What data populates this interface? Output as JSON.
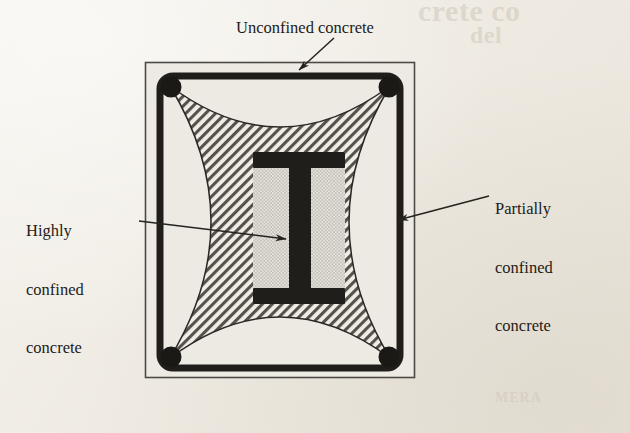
{
  "figure": {
    "background_color": "#efebe3",
    "ink_color": "#1d1b18"
  },
  "labels": {
    "unconfined": "Unconfined concrete",
    "highly_line1": "Highly",
    "highly_line2": "confined",
    "highly_line3": "concrete",
    "partially_line1": "Partially",
    "partially_line2": "confined",
    "partially_line3": "concrete"
  },
  "ghost_text": {
    "title": "crete co",
    "subtitle": "del",
    "footer": "MERA"
  },
  "regions": [
    {
      "name": "unconfined-concrete",
      "label": "Unconfined concrete",
      "fill": "light-plain",
      "fill_color": "#edeae4",
      "description": "Concrete cover outside the parabolic arching lines between tie corners"
    },
    {
      "name": "partially-confined-concrete",
      "label": "Partially confined concrete",
      "fill": "diagonal-hatch-45",
      "fill_color": "#4a4742",
      "description": "Concrete inside the ties but away from the encased steel section"
    },
    {
      "name": "highly-confined-concrete",
      "label": "Highly confined concrete",
      "fill": "fine-stipple-dots",
      "fill_color": "#7d7a73",
      "description": "Concrete directly adjacent to the steel web and between the flanges"
    }
  ],
  "components": {
    "section_outline": "outer concrete boundary rectangle",
    "tie": "rectangular stirrup with rounded corners",
    "rebar": "four corner longitudinal bars",
    "steel_section": "encased wide-flange I-beam"
  },
  "geometry": {
    "outer_box": {
      "x": 145,
      "y": 62,
      "width": 270,
      "height": 316
    },
    "tie_box": {
      "x": 160,
      "y": 76,
      "width": 240,
      "height": 292,
      "corner_radius": 13
    },
    "ibeam": {
      "flange_left": 253,
      "flange_right": 345,
      "top_flange_y": 152,
      "bottom_flange_y": 302,
      "flange_thickness": 15,
      "web_left": 289,
      "web_right": 311
    }
  },
  "leaders": [
    {
      "name": "unconfined",
      "from": [
        334,
        38
      ],
      "to": [
        297,
        71
      ]
    },
    {
      "name": "highly-confined",
      "from": [
        139,
        221
      ],
      "to": [
        288,
        239
      ]
    },
    {
      "name": "partially-confined",
      "from": [
        489,
        196
      ],
      "to": [
        396,
        221
      ]
    }
  ]
}
